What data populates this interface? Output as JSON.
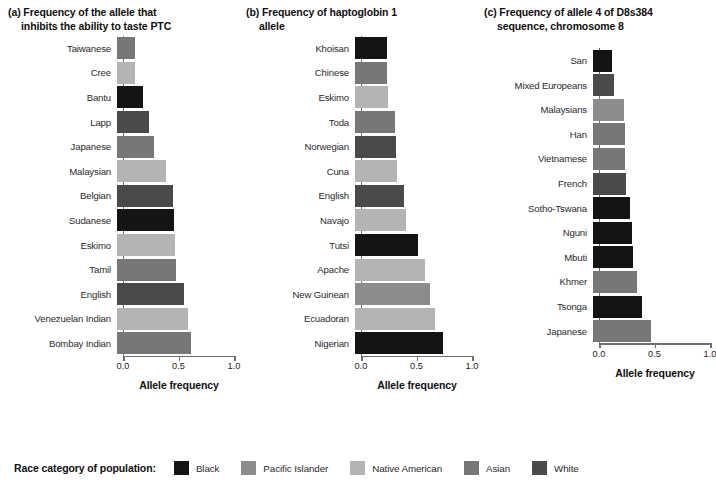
{
  "chart_data": [
    {
      "type": "bar",
      "panel": "(a)",
      "title_line1": "(a) Frequency of the allele that",
      "title_line2": "inhibits the ability to taste PTC",
      "xlabel": "Allele frequency",
      "ylabel": "",
      "xlim": [
        0,
        1
      ],
      "xticks": [
        "0.0",
        "0.5",
        "1.0"
      ],
      "xtick_values": [
        0,
        0.5,
        1
      ],
      "grid": false,
      "orientation": "horizontal",
      "categories": [
        "Taiwanese",
        "Cree",
        "Bantu",
        "Lapp",
        "Japanese",
        "Malaysian",
        "Belgian",
        "Sudanese",
        "Eskimo",
        "Tamil",
        "English",
        "Venezuelan Indian",
        "Bombay Indian"
      ],
      "values": [
        0.16,
        0.16,
        0.23,
        0.29,
        0.33,
        0.44,
        0.5,
        0.51,
        0.52,
        0.53,
        0.6,
        0.64,
        0.67
      ],
      "race_categories": [
        "Asian",
        "Native American",
        "Black",
        "White",
        "Asian",
        "Native American",
        "White",
        "Black",
        "Native American",
        "Asian",
        "White",
        "Native American",
        "Asian"
      ]
    },
    {
      "type": "bar",
      "panel": "(b)",
      "title_line1": "(b) Frequency of haptoglobin 1",
      "title_line2": "allele",
      "xlabel": "Allele frequency",
      "ylabel": "",
      "xlim": [
        0,
        1
      ],
      "xticks": [
        "0.0",
        "0.5",
        "1.0"
      ],
      "xtick_values": [
        0,
        0.5,
        1
      ],
      "grid": false,
      "orientation": "horizontal",
      "categories": [
        "Khoisan",
        "Chinese",
        "Eskimo",
        "Toda",
        "Norwegian",
        "Cuna",
        "English",
        "Navajo",
        "Tutsi",
        "Apache",
        "New Guinean",
        "Ecuadoran",
        "Nigerian"
      ],
      "values": [
        0.29,
        0.29,
        0.3,
        0.36,
        0.37,
        0.38,
        0.44,
        0.46,
        0.57,
        0.63,
        0.68,
        0.72,
        0.79
      ],
      "race_categories": [
        "Black",
        "Asian",
        "Native American",
        "Asian",
        "White",
        "Native American",
        "White",
        "Native American",
        "Black",
        "Native American",
        "Pacific Islander",
        "Native American",
        "Black"
      ]
    },
    {
      "type": "bar",
      "panel": "(c)",
      "title_line1": "(c) Frequency of allele 4 of D8s384",
      "title_line2": "sequence, chromosome 8",
      "xlabel": "Allele frequency",
      "ylabel": "",
      "xlim": [
        0,
        1
      ],
      "xticks": [
        "0.0",
        "0.5",
        "1.0"
      ],
      "xtick_values": [
        0,
        0.5,
        1
      ],
      "grid": false,
      "orientation": "horizontal",
      "categories": [
        "San",
        "Mixed Europeans",
        "Malaysians",
        "Han",
        "Vietnamese",
        "French",
        "Sotho-Tswana",
        "Nguni",
        "Mbuti",
        "Khmer",
        "Tsonga",
        "Japanese"
      ],
      "values": [
        0.17,
        0.19,
        0.28,
        0.29,
        0.29,
        0.3,
        0.33,
        0.35,
        0.36,
        0.4,
        0.44,
        0.52
      ],
      "race_categories": [
        "Black",
        "White",
        "Pacific Islander",
        "Asian",
        "Asian",
        "White",
        "Black",
        "Black",
        "Black",
        "Asian",
        "Black",
        "Asian"
      ]
    }
  ],
  "legend": {
    "title": "Race category of population:",
    "items": [
      {
        "label": "Black",
        "color": "#141414"
      },
      {
        "label": "Pacific Islander",
        "color": "#8c8c8c"
      },
      {
        "label": "Native American",
        "color": "#b4b4b4"
      },
      {
        "label": "Asian",
        "color": "#777777"
      },
      {
        "label": "White",
        "color": "#4a4a4a"
      }
    ]
  },
  "colors": {
    "Black": "#141414",
    "Pacific Islander": "#8c8c8c",
    "Native American": "#b4b4b4",
    "Asian": "#777777",
    "White": "#4a4a4a",
    "axis": "#6f6f6f",
    "text": "#2a2a2a",
    "background": "#ffffff"
  }
}
